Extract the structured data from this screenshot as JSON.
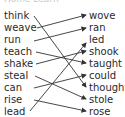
{
  "header": {
    "title": "Home Learn"
  },
  "left_words": [
    "think",
    "weave",
    "run",
    "teach",
    "shake",
    "steal",
    "can",
    "rise",
    "lead"
  ],
  "right_words": [
    "wove",
    "ran",
    "led",
    "shook",
    "taught",
    "could",
    "thought",
    "stole",
    "rose"
  ],
  "connections": [
    {
      "from": "think",
      "to": "thought"
    },
    {
      "from": "weave",
      "to": "wove"
    },
    {
      "from": "run",
      "to": "ran"
    },
    {
      "from": "teach",
      "to": "taught"
    },
    {
      "from": "shake",
      "to": "shook"
    },
    {
      "from": "steal",
      "to": "stole"
    },
    {
      "from": "can",
      "to": "could"
    },
    {
      "from": "rise",
      "to": "rose"
    },
    {
      "from": "lead",
      "to": "led"
    }
  ],
  "colors": {
    "text": "#2a2a2a",
    "line": "#333333"
  }
}
